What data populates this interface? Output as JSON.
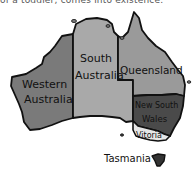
{
  "top_text": "of a toddler, comes into existence.",
  "map": {
    "title": "Australia states map (hand-drawn)",
    "regions": [
      {
        "id": "western-australia",
        "label_lines": [
          "Western",
          "Australia"
        ],
        "color": "#7a7a7a"
      },
      {
        "id": "south-australia",
        "label_lines": [
          "South",
          "Australia"
        ],
        "color": "#a9a9a9"
      },
      {
        "id": "queensland",
        "label_lines": [
          "Queensland"
        ],
        "color": "#9a9a9a"
      },
      {
        "id": "new-south-wales",
        "label_lines": [
          "New South",
          "Wales"
        ],
        "color": "#4a4a4a"
      },
      {
        "id": "victoria",
        "label_lines": [
          "Vitoria"
        ],
        "color": "#e6e6e6"
      },
      {
        "id": "tasmania",
        "label_lines": [
          "Tasmania"
        ],
        "color": "#333333"
      }
    ],
    "outline_color": "#111111"
  }
}
